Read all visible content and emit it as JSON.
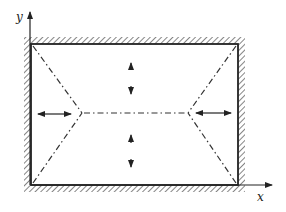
{
  "diagram": {
    "title": "",
    "axes": {
      "x_label": "x",
      "y_label": "y"
    },
    "plate": {
      "x1": 31,
      "y1": 44,
      "x2": 238,
      "y2": 185,
      "edges": "all four edges clamped (hatched)"
    },
    "yield_lines": {
      "nodes": [
        {
          "x": 82,
          "y": 113
        },
        {
          "x": 188,
          "y": 113
        }
      ],
      "style": "dash-dot"
    },
    "arrows": [
      {
        "direction": "vertical-double",
        "cx": 131,
        "cy": 78
      },
      {
        "direction": "vertical-double",
        "cx": 131,
        "cy": 151
      },
      {
        "direction": "horizontal-double",
        "cx": 54,
        "cy": 114
      },
      {
        "direction": "horizontal-double",
        "cx": 213,
        "cy": 113
      }
    ],
    "colors": {
      "line": "#222222",
      "background": "#ffffff"
    }
  }
}
